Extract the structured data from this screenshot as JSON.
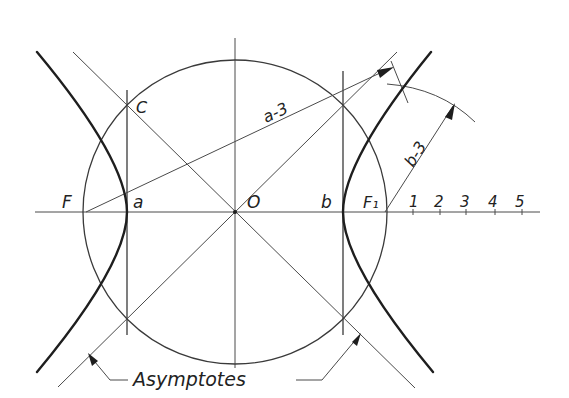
{
  "diagram": {
    "labels": {
      "F": "F",
      "a": "a",
      "O": "O",
      "b": "b",
      "F1": "F₁",
      "C": "C",
      "a3": "a-3",
      "b3": "b-3",
      "asymptotes": "Asymptotes"
    },
    "scale_ticks": [
      "1",
      "2",
      "3",
      "4",
      "5"
    ],
    "colors": {
      "background": "#ffffff",
      "line": "#3a3a3a",
      "curve": "#1e1e1e"
    },
    "geometry": {
      "center": [
        235,
        212
      ],
      "circle_radius": 151,
      "vertex_left_x": 127,
      "vertex_right_x": 343,
      "focus_left_x": 86,
      "focus_right_x": 385
    }
  }
}
